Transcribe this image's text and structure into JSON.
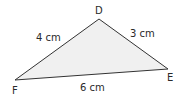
{
  "diagram": {
    "type": "triangle",
    "fill": "#f0f0f0",
    "stroke": "#333333",
    "vertices": [
      {
        "name": "D",
        "x": 99,
        "y": 19
      },
      {
        "name": "E",
        "x": 168,
        "y": 69
      },
      {
        "name": "F",
        "x": 15,
        "y": 80
      }
    ],
    "vertex_labels": {
      "D": "D",
      "E": "E",
      "F": "F"
    },
    "sides": {
      "DF": "4 cm",
      "DE": "3 cm",
      "EF": "6 cm"
    }
  }
}
